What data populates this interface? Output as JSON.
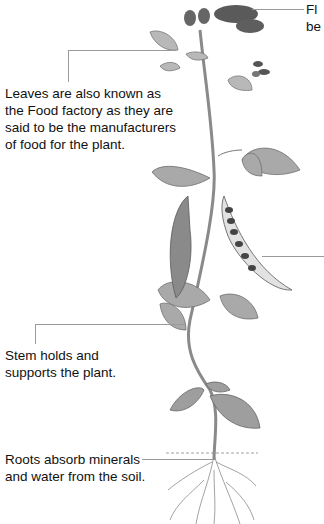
{
  "diagram": {
    "labels": {
      "flower": [
        "Fl",
        "be"
      ],
      "leaves": [
        "Leaves are also known as",
        "the Food factory as they are",
        "said to be the manufacturers",
        "of food for the plant."
      ],
      "stem": [
        "Stem holds and",
        "supports the plant."
      ],
      "roots": [
        "Roots absorb minerals",
        "and water from the soil."
      ]
    },
    "parts": [
      "flower",
      "leaves",
      "stem",
      "pod",
      "roots"
    ],
    "colors": {
      "text": "#111111",
      "leader_line": "#9a9a9a",
      "plant_dark": "#5a5a5a",
      "plant_mid": "#8c8c8c",
      "plant_light": "#cfcfcf"
    }
  }
}
